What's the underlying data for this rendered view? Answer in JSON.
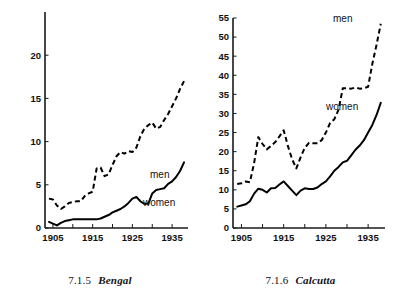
{
  "page": {
    "background": "#ffffff",
    "ink": "#000000"
  },
  "figures": [
    {
      "id": "bengal",
      "caption_number": "7.1.5",
      "caption_name": "Bengal",
      "series_labels": {
        "men": "men",
        "women": "women"
      }
    },
    {
      "id": "calcutta",
      "caption_number": "7.1.6",
      "caption_name": "Calcutta",
      "series_labels": {
        "men": "men",
        "women": "women"
      }
    }
  ],
  "chart_data": [
    {
      "type": "line",
      "title": "7.1.5 Bengal",
      "xlabel": "",
      "ylabel": "",
      "xlim": [
        1903,
        1939
      ],
      "ylim": [
        0,
        25
      ],
      "yticks": [
        0,
        5,
        10,
        15,
        20
      ],
      "ytick_labels": [
        "0",
        "5",
        "10",
        "15",
        "20"
      ],
      "xticks": [
        1905,
        1910,
        1915,
        1920,
        1925,
        1930,
        1935
      ],
      "xtick_labels": [
        "1905",
        "",
        "1915",
        "",
        "1925",
        "",
        "1935"
      ],
      "grid": false,
      "legend": "inline-annotation",
      "x": [
        1904,
        1905,
        1906,
        1907,
        1908,
        1909,
        1910,
        1911,
        1912,
        1913,
        1914,
        1915,
        1916,
        1917,
        1918,
        1919,
        1920,
        1921,
        1922,
        1923,
        1924,
        1925,
        1926,
        1927,
        1928,
        1929,
        1930,
        1931,
        1932,
        1933,
        1934,
        1935,
        1936,
        1937,
        1938
      ],
      "series": [
        {
          "name": "men",
          "style": "dashed",
          "values": [
            3.4,
            3.3,
            2.6,
            2.2,
            2.5,
            2.9,
            3.0,
            3.1,
            3.1,
            3.7,
            4.0,
            4.2,
            6.9,
            7.0,
            6.0,
            6.2,
            7.3,
            8.3,
            8.8,
            8.6,
            8.9,
            8.8,
            9.3,
            10.6,
            11.5,
            11.9,
            12.2,
            11.5,
            11.7,
            12.5,
            13.2,
            14.1,
            15.0,
            16.1,
            17.0
          ]
        },
        {
          "name": "women",
          "style": "solid",
          "values": [
            0.7,
            0.5,
            0.3,
            0.6,
            0.8,
            0.9,
            1.0,
            1.0,
            1.0,
            1.0,
            1.0,
            1.0,
            1.0,
            1.1,
            1.3,
            1.5,
            1.8,
            2.0,
            2.2,
            2.5,
            2.9,
            3.4,
            3.6,
            3.1,
            2.8,
            2.8,
            4.0,
            4.4,
            4.5,
            4.6,
            5.1,
            5.4,
            5.9,
            6.6,
            7.6
          ]
        }
      ]
    },
    {
      "type": "line",
      "title": "7.1.6 Calcutta",
      "xlabel": "",
      "ylabel": "",
      "xlim": [
        1903,
        1939
      ],
      "ylim": [
        0,
        55
      ],
      "yticks": [
        0,
        5,
        10,
        15,
        20,
        25,
        30,
        35,
        40,
        45,
        50,
        55
      ],
      "ytick_labels": [
        "0",
        "5",
        "10",
        "15",
        "20",
        "25",
        "30",
        "35",
        "40",
        "45",
        "50",
        "55"
      ],
      "xticks": [
        1905,
        1910,
        1915,
        1920,
        1925,
        1930,
        1935
      ],
      "xtick_labels": [
        "1905",
        "",
        "1915",
        "",
        "1925",
        "",
        "1935"
      ],
      "grid": false,
      "legend": "inline-annotation",
      "x": [
        1904,
        1905,
        1906,
        1907,
        1908,
        1909,
        1910,
        1911,
        1912,
        1913,
        1914,
        1915,
        1916,
        1917,
        1918,
        1919,
        1920,
        1921,
        1922,
        1923,
        1924,
        1925,
        1926,
        1927,
        1928,
        1929,
        1930,
        1931,
        1932,
        1933,
        1934,
        1935,
        1936,
        1937,
        1938
      ],
      "series": [
        {
          "name": "men",
          "style": "dashed",
          "values": [
            11.5,
            11.7,
            12.2,
            12.0,
            17.0,
            23.8,
            22.0,
            20.6,
            21.5,
            22.5,
            24.0,
            25.6,
            21.5,
            18.0,
            15.6,
            18.5,
            21.0,
            22.3,
            22.2,
            22.2,
            23.0,
            25.0,
            27.5,
            28.5,
            31.0,
            36.6,
            36.6,
            36.5,
            36.8,
            36.5,
            36.6,
            37.0,
            43.0,
            48.0,
            53.5
          ]
        },
        {
          "name": "women",
          "style": "solid",
          "values": [
            5.6,
            5.9,
            6.2,
            7.0,
            9.0,
            10.3,
            10.0,
            9.3,
            10.4,
            10.5,
            11.4,
            12.2,
            11.0,
            9.8,
            8.6,
            9.8,
            10.4,
            10.2,
            10.2,
            10.6,
            11.5,
            12.2,
            13.5,
            15.0,
            16.0,
            17.2,
            17.6,
            19.0,
            20.5,
            21.6,
            23.0,
            25.0,
            27.0,
            29.6,
            32.8
          ]
        }
      ]
    }
  ]
}
